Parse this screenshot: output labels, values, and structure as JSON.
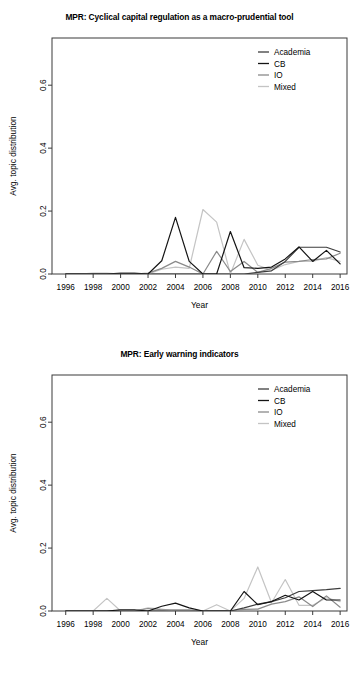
{
  "figure": {
    "background": "#ffffff",
    "panel_count": 2
  },
  "series_style": {
    "Academia": "#3d3d3d",
    "CB": "#141414",
    "IO": "#8a8a8a",
    "Mixed": "#c4c4c4"
  },
  "panels": [
    {
      "id": "panel-cyclical-capital-regulation",
      "title": "MPR: Cyclical capital regulation as a macro-prudential tool",
      "xlabel": "Year",
      "ylabel": "Avg. topic distribution",
      "legend": [
        "Academia",
        "CB",
        "IO",
        "Mixed"
      ]
    },
    {
      "id": "panel-early-warning-indicators",
      "title": "MPR: Early warning indicators",
      "xlabel": "Year",
      "ylabel": "Avg. topic distribution",
      "legend": [
        "Academia",
        "CB",
        "IO",
        "Mixed"
      ]
    }
  ],
  "chart_data": [
    {
      "type": "line",
      "title": "MPR: Cyclical capital regulation as a macro-prudential tool",
      "xlabel": "Year",
      "ylabel": "Avg. topic distribution",
      "xlim": [
        1995,
        2016.5
      ],
      "ylim": [
        0.0,
        0.75
      ],
      "xticks": [
        1996,
        1998,
        2000,
        2002,
        2004,
        2006,
        2008,
        2010,
        2012,
        2014,
        2016
      ],
      "yticks": [
        0.0,
        0.2,
        0.4,
        0.6
      ],
      "grid": false,
      "legend_position": "top-right",
      "x": [
        1996,
        1997,
        1998,
        1999,
        2000,
        2001,
        2002,
        2003,
        2004,
        2005,
        2006,
        2007,
        2008,
        2009,
        2010,
        2011,
        2012,
        2013,
        2014,
        2015,
        2016
      ],
      "series": [
        {
          "name": "Academia",
          "color": "#3d3d3d",
          "values": [
            0.0,
            0.0,
            0.0,
            0.0,
            0.003,
            0.003,
            0.0,
            0.0,
            0.0,
            0.0,
            0.0,
            0.0,
            0.0,
            0.0,
            0.005,
            0.01,
            0.04,
            0.085,
            0.085,
            0.085,
            0.07
          ]
        },
        {
          "name": "CB",
          "color": "#141414",
          "values": [
            0.0,
            0.0,
            0.0,
            0.0,
            0.0,
            0.0,
            0.0,
            0.042,
            0.18,
            0.04,
            0.0,
            0.0,
            0.135,
            0.02,
            0.018,
            0.022,
            0.048,
            0.086,
            0.04,
            0.075,
            0.032
          ]
        },
        {
          "name": "IO",
          "color": "#8a8a8a",
          "values": [
            0.0,
            0.0,
            0.0,
            0.0,
            0.0,
            0.0,
            0.003,
            0.018,
            0.04,
            0.022,
            0.0,
            0.072,
            0.008,
            0.04,
            0.005,
            0.018,
            0.038,
            0.04,
            0.046,
            0.048,
            0.066
          ]
        },
        {
          "name": "Mixed",
          "color": "#c4c4c4",
          "values": [
            0.0,
            0.0,
            0.003,
            0.003,
            0.0,
            0.0,
            0.0,
            0.015,
            0.022,
            0.018,
            0.205,
            0.165,
            0.0,
            0.11,
            0.028,
            0.012,
            0.03,
            0.04,
            0.04,
            0.052,
            0.04
          ]
        }
      ]
    },
    {
      "type": "line",
      "title": "MPR: Early warning indicators",
      "xlabel": "Year",
      "ylabel": "Avg. topic distribution",
      "xlim": [
        1995,
        2016.5
      ],
      "ylim": [
        0.0,
        0.75
      ],
      "xticks": [
        1996,
        1998,
        2000,
        2002,
        2004,
        2006,
        2008,
        2010,
        2012,
        2014,
        2016
      ],
      "yticks": [
        0.0,
        0.2,
        0.4,
        0.6
      ],
      "grid": false,
      "legend_position": "top-right",
      "x": [
        1996,
        1997,
        1998,
        1999,
        2000,
        2001,
        2002,
        2003,
        2004,
        2005,
        2006,
        2007,
        2008,
        2009,
        2010,
        2011,
        2012,
        2013,
        2014,
        2015,
        2016
      ],
      "series": [
        {
          "name": "Academia",
          "color": "#3d3d3d",
          "values": [
            0.0,
            0.0,
            0.0,
            0.0,
            0.0,
            0.0,
            0.0,
            0.0,
            0.0,
            0.0,
            0.0,
            0.0,
            0.0,
            0.01,
            0.022,
            0.03,
            0.042,
            0.062,
            0.065,
            0.068,
            0.072
          ]
        },
        {
          "name": "CB",
          "color": "#141414",
          "values": [
            0.0,
            0.0,
            0.0,
            0.0,
            0.004,
            0.004,
            0.0,
            0.015,
            0.025,
            0.01,
            0.0,
            0.0,
            0.0,
            0.062,
            0.02,
            0.03,
            0.05,
            0.035,
            0.062,
            0.035,
            0.035
          ]
        },
        {
          "name": "IO",
          "color": "#8a8a8a",
          "values": [
            0.0,
            0.0,
            0.0,
            0.0,
            0.0,
            0.0,
            0.008,
            0.004,
            0.004,
            0.004,
            0.0,
            0.0,
            0.0,
            0.005,
            0.006,
            0.022,
            0.03,
            0.045,
            0.014,
            0.048,
            0.012
          ]
        },
        {
          "name": "Mixed",
          "color": "#c4c4c4",
          "values": [
            0.0,
            0.0,
            0.0,
            0.04,
            0.0,
            0.0,
            0.01,
            0.006,
            0.0,
            0.0,
            0.0,
            0.02,
            0.0,
            0.04,
            0.14,
            0.026,
            0.1,
            0.018,
            0.018,
            0.042,
            0.03
          ]
        }
      ]
    }
  ]
}
